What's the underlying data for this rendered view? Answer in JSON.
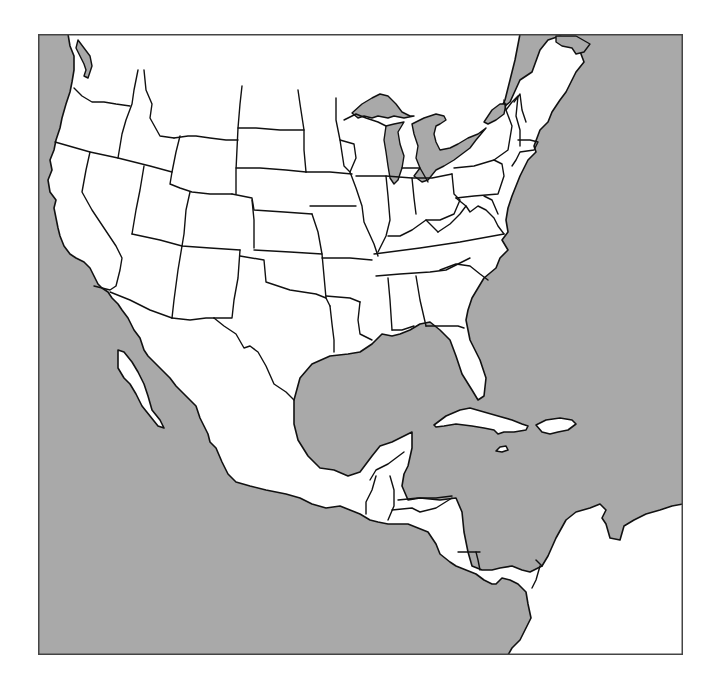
{
  "map": {
    "type": "blank-outline-map",
    "region": "North and Central America",
    "colors": {
      "water": "#a9a9a9",
      "land": "#ffffff",
      "border": "#111111",
      "frame": "#444444"
    },
    "labels": []
  }
}
